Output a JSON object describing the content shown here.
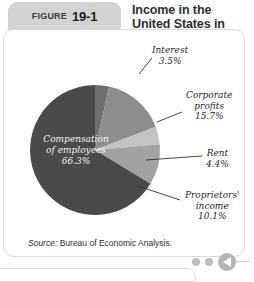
{
  "header": {
    "figure_word": "FIGURE",
    "figure_number": "19-1",
    "title": "Income in the United States in 2013"
  },
  "source": {
    "label": "Source:",
    "text": " Bureau of Economic Analysis."
  },
  "decorations": {
    "dot_color": "#bdbdbd",
    "circle_color": "#b4b4b4",
    "play_icon": "triangle-left-icon"
  },
  "chart_data": {
    "type": "pie",
    "title": "Income in the United States in 2013",
    "subtitle": "",
    "xlabel": "",
    "ylabel": "",
    "unit": "%",
    "legend_position": "none",
    "labels_inside": [
      "Compensation of employees"
    ],
    "categories": [
      "Compensation of employees",
      "Interest",
      "Corporate profits",
      "Rent",
      "Proprietors' income"
    ],
    "values": [
      66.3,
      3.5,
      15.7,
      4.4,
      10.1
    ],
    "slices": [
      {
        "name": "Compensation of employees",
        "label_line1": "Compensation",
        "label_line2": "of employees",
        "value": 66.3,
        "value_text": "66.3%",
        "color": "#4a4a4a",
        "label_placement": "inside"
      },
      {
        "name": "Interest",
        "label_line1": "Interest",
        "label_line2": "",
        "value": 3.5,
        "value_text": "3.5%",
        "color": "#6f6f6f",
        "label_placement": "outside-top"
      },
      {
        "name": "Corporate profits",
        "label_line1": "Corporate",
        "label_line2": "profits",
        "value": 15.7,
        "value_text": "15.7%",
        "color": "#8d8d8d",
        "label_placement": "outside-right"
      },
      {
        "name": "Rent",
        "label_line1": "Rent",
        "label_line2": "",
        "value": 4.4,
        "value_text": "4.4%",
        "color": "#c3c3c3",
        "label_placement": "outside-right"
      },
      {
        "name": "Proprietors' income",
        "label_line1": "Proprietors'",
        "label_line2": "income",
        "value": 10.1,
        "value_text": "10.1%",
        "color": "#a2a2a2",
        "label_placement": "outside-bottom-right"
      }
    ],
    "total": 100.0
  }
}
